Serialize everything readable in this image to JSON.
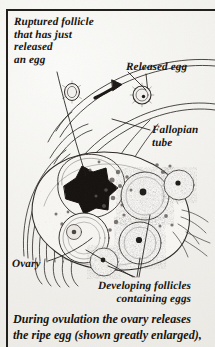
{
  "figure": {
    "type": "anatomical-illustration",
    "background_color": "#f1f0ec",
    "ink_color": "#231f1d",
    "frame": {
      "visible_sides": "top-and-left",
      "color": "#231f1d"
    }
  },
  "labels": {
    "ruptured_follicle": "Ruptured follicle\nthat has just\nreleased\nan egg",
    "released_egg": "Released egg",
    "fallopian_tube": "Fallopian\ntube",
    "ovary": "Ovary",
    "developing_follicles": "Developing follicles\ncontaining eggs"
  },
  "caption": {
    "text": "During ovulation the ovary releases\nthe ripe egg (shown greatly enlarged),"
  },
  "structures": [
    {
      "name": "ovary-body",
      "description": "large oval organ, stippled interior"
    },
    {
      "name": "fallopian-tube",
      "description": "curved double-line duct sweeping from upper right"
    },
    {
      "name": "fimbriae",
      "description": "finger-like fringed projections on the left of the ovary"
    },
    {
      "name": "ruptured-follicle",
      "description": "dark star-shaped burst follicle",
      "fill": "#14110e"
    },
    {
      "name": "developing-follicle",
      "count": 4,
      "description": "round granular follicles containing eggs"
    },
    {
      "name": "released-egg",
      "description": "small circle with central dot, upper right"
    },
    {
      "name": "travelling-egg",
      "description": "small circle left of the arrow"
    },
    {
      "name": "motion-arrow",
      "description": "curved arrow showing egg travel direction"
    }
  ]
}
